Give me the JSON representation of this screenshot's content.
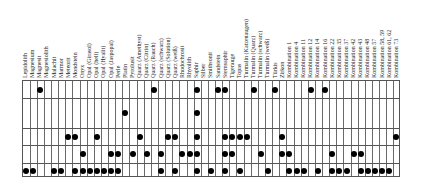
{
  "table": {
    "columns": [
      "Lepidolith",
      "Magnesium",
      "Magnesit",
      "Magnesiolith",
      "Malachit",
      "Marmor",
      "Meteorit",
      "Mondstein",
      "Onyx",
      "Opal (Girasol)",
      "Opal (hell)",
      "Opal (Hyalit)",
      "Opal (Jaspopal)",
      "Perle",
      "Platin",
      "Pyrolusit",
      "Quarz (Amethyst)",
      "Quarz (Citrin)",
      "Quarz (Rauch)",
      "Quarz (schwarz)",
      "Quarz (Solution)",
      "Quarz (weiß)",
      "Rhodochrosit",
      "Rhyolith",
      "Saphir",
      "Silber",
      "Smithsonit",
      "Sandstein",
      "Sternsaphir",
      "Tigerauge",
      "Topas",
      "Turmalin (Katzenaugen)",
      "Turmalin (Quarz)",
      "Turmalin (schwarz)",
      "Turmalin (weiß)",
      "Türkis",
      "Zirkon",
      "Kombination 1",
      "Kombination 4",
      "Kombination 11",
      "Kombination 12",
      "Kombination 14",
      "Kombination 16",
      "Kombination 22",
      "Kombination 35",
      "Kombination 37",
      "Kombination 42",
      "Kombination 43",
      "Kombination 48",
      "Kombination 57",
      "Kombination 58, 59",
      "Kombination 61, 62",
      "Kombination 73"
    ],
    "row_heights": [
      17,
      30,
      17,
      18,
      15
    ],
    "rows": [
      {
        "marks": [
          2,
          18,
          24,
          27,
          28,
          32,
          35,
          40,
          42
        ]
      },
      {
        "marks": [
          14,
          24
        ]
      },
      {
        "marks": [
          6,
          7,
          10,
          16,
          20,
          21,
          24,
          28,
          29,
          30,
          31,
          36,
          52
        ]
      },
      {
        "marks": [
          8,
          12,
          13,
          15,
          17,
          19,
          22,
          23,
          24,
          28,
          29,
          33,
          36,
          37,
          43,
          46,
          47
        ]
      },
      {
        "marks": [
          0,
          1,
          4,
          5,
          7,
          8,
          9,
          10,
          11,
          12,
          13,
          19,
          21,
          24,
          26,
          28,
          30,
          34,
          37,
          38,
          39,
          41,
          43,
          44,
          45,
          47,
          48,
          49,
          50,
          51
        ]
      }
    ],
    "mark_symbol": "filled-circle",
    "colors": {
      "grid": "#555555",
      "mark": "#000000",
      "background": "#ffffff"
    }
  }
}
